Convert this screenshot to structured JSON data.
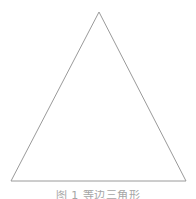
{
  "figure": {
    "background_color": "#ffffff",
    "width": 196,
    "height": 199,
    "caption": {
      "text": "图 1  等边三角形",
      "clipped": "true",
      "color": "#8d8d8d"
    },
    "shape": {
      "name": "triangle",
      "kind": "isosceles-triangle",
      "stroke_color": "#9a9a9a",
      "stroke_width": 1,
      "fill": "none",
      "vertices": {
        "apex": {
          "x": 99,
          "y": 12
        },
        "bottom_left": {
          "x": 11,
          "y": 181
        },
        "bottom_right": {
          "x": 186,
          "y": 181
        }
      },
      "points": "99,12 11,181 186,181"
    }
  }
}
